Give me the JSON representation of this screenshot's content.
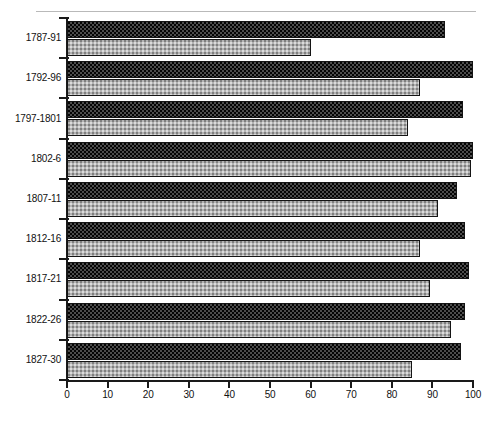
{
  "chart_data": {
    "type": "bar",
    "orientation": "horizontal",
    "title": "",
    "subtitle": "",
    "xlabel": "",
    "ylabel": "",
    "xlim": [
      0,
      100
    ],
    "ylim": null,
    "grid": false,
    "legend": null,
    "legend_position": "none",
    "xticks": [
      0,
      10,
      20,
      30,
      40,
      50,
      60,
      70,
      80,
      90,
      100
    ],
    "xticklabels": [
      "0",
      "10",
      "20",
      "30",
      "40",
      "50",
      "60",
      "70",
      "80",
      "90",
      "100"
    ],
    "categories": [
      "1787-91",
      "1792-96",
      "1797-1801",
      "1802-6",
      "1807-11",
      "1812-16",
      "1817-21",
      "1822-26",
      "1827-30"
    ],
    "series": [
      {
        "name": "series-dark",
        "style": "dark-crosshatch",
        "color": "#4c4c4c",
        "values": [
          93,
          100,
          97.5,
          100,
          96,
          98,
          99,
          98,
          97
        ]
      },
      {
        "name": "series-light",
        "style": "light-stipple",
        "color": "#b3b3b3",
        "values": [
          60,
          87,
          84,
          99.5,
          91.5,
          87,
          89.5,
          94.5,
          85
        ]
      }
    ]
  },
  "axes": {
    "x_axis_name": "x-axis",
    "y_axis_name": "y-axis"
  }
}
